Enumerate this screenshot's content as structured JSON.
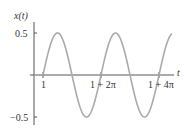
{
  "chart_data": {
    "type": "line",
    "title": "",
    "xlabel": "t",
    "ylabel": "x(t)",
    "x_ticks": [
      {
        "value": 1,
        "label": "1"
      },
      {
        "value": 7.2832,
        "label": "1 + 2π"
      },
      {
        "value": 13.5664,
        "label": "1 + 4π"
      }
    ],
    "y_ticks": [
      {
        "value": 0.5,
        "label": "0.5"
      },
      {
        "value": -0.5,
        "label": "-0.5"
      }
    ],
    "xlim": [
      0,
      14.4
    ],
    "ylim": [
      -0.55,
      0.55
    ],
    "grid": false,
    "legend": null,
    "series": [
      {
        "name": "x(t)",
        "description": "x(t) = 0 for t < 1, x(t) = 0.5 sin(t - 1) for t >= 1",
        "amplitude": 0.5,
        "start": 1,
        "color": "#aaaaaa",
        "x": [
          0,
          1,
          2.5708,
          4.1416,
          5.7124,
          7.2832,
          8.854,
          10.4248,
          11.9956,
          13.5664,
          14.2
        ],
        "values": [
          0,
          0,
          0.5,
          0,
          -0.5,
          0,
          0.5,
          0,
          -0.5,
          0,
          0.3
        ]
      }
    ]
  },
  "labels": {
    "y_axis": "x(t)",
    "x_axis": "t",
    "y_top": "0.5",
    "y_bottom": "−0.5",
    "x1": "1",
    "x2": "1 + 2π",
    "x3": "1 + 4π"
  }
}
